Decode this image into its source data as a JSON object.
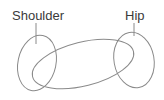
{
  "diagram": {
    "labels": {
      "shoulder": "Shoulder",
      "hip": "Hip"
    },
    "colors": {
      "text": "#3a3a3a",
      "stroke": "#8a8a8a",
      "background": "#ffffff"
    }
  }
}
